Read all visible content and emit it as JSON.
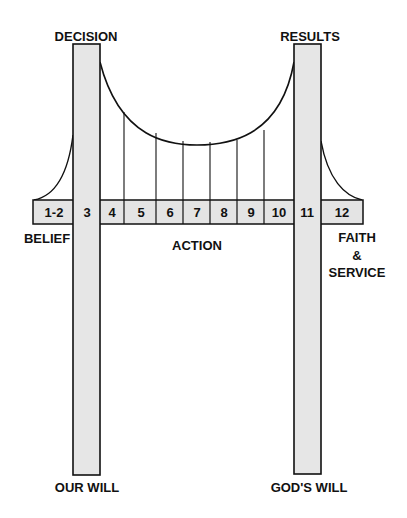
{
  "diagram": {
    "labels": {
      "decision": "DECISION",
      "results": "RESULTS",
      "belief": "BELIEF",
      "action": "ACTION",
      "faith": "FAITH",
      "amp": "&",
      "service": "SERVICE",
      "our_will": "OUR WILL",
      "gods_will": "GOD'S WILL"
    },
    "steps": [
      "1-2",
      "3",
      "4",
      "5",
      "6",
      "7",
      "8",
      "9",
      "10",
      "11",
      "12"
    ],
    "colors": {
      "tower_fill": "#e6e6e6",
      "deck_fill": "#e4e4e4",
      "stroke": "#111111"
    }
  }
}
